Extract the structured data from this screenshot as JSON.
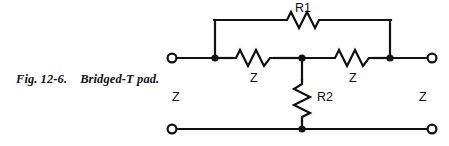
{
  "figure": {
    "caption_prefix": "Fig.",
    "caption_number": "12-6.",
    "caption_title": "Bridged-T pad.",
    "caption_full": "Fig. 12-6.   Bridged-T pad."
  },
  "schematic": {
    "type": "circuit-diagram",
    "name": "Bridged-T attenuator pad",
    "stroke_color": "#111111",
    "background_color": "#ffffff",
    "labels": {
      "bridge_resistor": "R1",
      "series_resistor_left": "Z",
      "series_resistor_right": "Z",
      "shunt_resistor": "R2",
      "source_impedance": "Z",
      "load_impedance": "Z"
    },
    "components": [
      {
        "id": "r1",
        "label": "R1",
        "kind": "resistor",
        "orientation": "horizontal",
        "branch": "bridge"
      },
      {
        "id": "z-left",
        "label": "Z",
        "kind": "resistor",
        "orientation": "horizontal",
        "branch": "series-left"
      },
      {
        "id": "z-right",
        "label": "Z",
        "kind": "resistor",
        "orientation": "horizontal",
        "branch": "series-right"
      },
      {
        "id": "r2",
        "label": "R2",
        "kind": "resistor",
        "orientation": "vertical",
        "branch": "shunt"
      }
    ],
    "terminals": [
      {
        "id": "in-top",
        "position": "top-left"
      },
      {
        "id": "out-top",
        "position": "top-right"
      },
      {
        "id": "in-bottom",
        "position": "bottom-left"
      },
      {
        "id": "out-bottom",
        "position": "bottom-right"
      }
    ],
    "nodes": [
      {
        "id": "node-a",
        "x": 215,
        "y": 58
      },
      {
        "id": "node-mid",
        "x": 302,
        "y": 58
      },
      {
        "id": "node-b",
        "x": 390,
        "y": 58
      },
      {
        "id": "node-gnd",
        "x": 302,
        "y": 129
      }
    ]
  }
}
